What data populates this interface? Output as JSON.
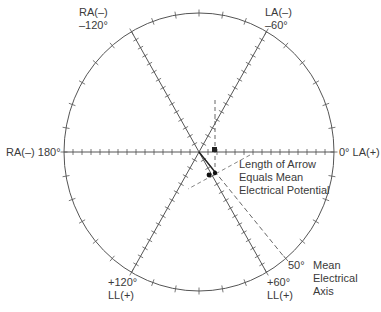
{
  "diagram": {
    "center": {
      "x": 199,
      "y": 152
    },
    "radius": {
      "rx": 135,
      "ry": 139
    },
    "colors": {
      "line": "#555555",
      "text": "#3a3a3a",
      "background": "#ffffff"
    },
    "labels": {
      "ra_minus_120": [
        "RA(–)",
        "–120°"
      ],
      "la_minus_60": [
        "LA(–)",
        "–60°"
      ],
      "ra_180": "RA(–) 180°",
      "la_0": "0° LA(+)",
      "ll_120": [
        "+120°",
        "LL(+)"
      ],
      "ll_60": [
        "+60°",
        "LL(+)"
      ],
      "deg_50": "50°",
      "mean_axis": [
        "Mean",
        "Electrical",
        "Axis"
      ],
      "arrow_note": [
        "Length of Arrow",
        "Equals Mean",
        "Electrical Potential"
      ]
    },
    "axes_deg": [
      0,
      60,
      120
    ],
    "mean_axis_deg": 50
  }
}
